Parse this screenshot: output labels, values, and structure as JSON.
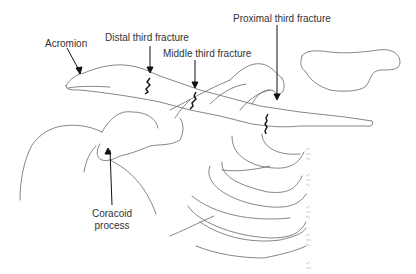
{
  "diagram": {
    "labels": {
      "acromion": "Acromion",
      "distal": "Distal third fracture",
      "middle": "Middle third fracture",
      "proximal": "Proximal third fracture",
      "coracoid_line1": "Coracoid",
      "coracoid_line2": "process"
    },
    "colors": {
      "outline": "#555555",
      "fracture": "#111111",
      "text": "#333333",
      "background": "#ffffff"
    }
  }
}
